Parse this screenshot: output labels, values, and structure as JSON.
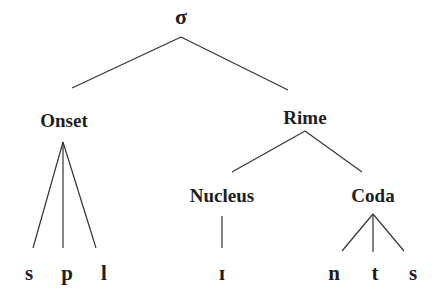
{
  "diagram": {
    "type": "syllable-tree",
    "root": {
      "label": "σ"
    },
    "nodes": {
      "onset": {
        "label": "Onset"
      },
      "rime": {
        "label": "Rime"
      },
      "nucleus": {
        "label": "Nucleus"
      },
      "coda": {
        "label": "Coda"
      }
    },
    "segments": {
      "onset": [
        "s",
        "p",
        "l"
      ],
      "nucleus": [
        "ɪ"
      ],
      "coda": [
        "n",
        "t",
        "s"
      ]
    },
    "edges": [
      [
        "σ",
        "Onset"
      ],
      [
        "σ",
        "Rime"
      ],
      [
        "Rime",
        "Nucleus"
      ],
      [
        "Rime",
        "Coda"
      ],
      [
        "Onset",
        "s"
      ],
      [
        "Onset",
        "p"
      ],
      [
        "Onset",
        "l"
      ],
      [
        "Nucleus",
        "ɪ"
      ],
      [
        "Coda",
        "n"
      ],
      [
        "Coda",
        "t"
      ],
      [
        "Coda",
        "s"
      ]
    ],
    "colors": {
      "text": "#1e1e1e",
      "line": "#333333",
      "background": "#ffffff"
    }
  }
}
